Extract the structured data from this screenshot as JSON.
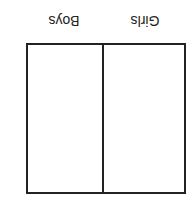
{
  "table": {
    "columns": [
      "Girls",
      "Boys"
    ],
    "orientation": "rotated 180 degrees",
    "rows": [
      [
        "",
        ""
      ]
    ]
  }
}
